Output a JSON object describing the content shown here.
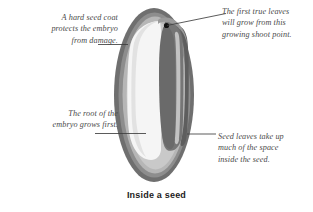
{
  "figure": {
    "caption": "Inside a seed"
  },
  "labels": {
    "seed_coat": "A hard seed coat\nprotects the embryo\nfrom damage.",
    "root": "The root of the\nembryo grows first.",
    "first_leaves": "The first true leaves\nwill grow from this\ngrowing shoot point.",
    "seed_leaves": "Seed leaves take up\nmuch of the space\ninside the seed."
  },
  "colors": {
    "background": "#ffffff",
    "seed_coat_outer": "#6f6f6f",
    "seed_coat_mid": "#8d8d8d",
    "seed_coat_inner": "#b6b6b6",
    "endosperm": "#c9c9c9",
    "root": "#f5f5f5",
    "cotyledon": "#767676",
    "cotyledon_shade": "#5e5e5e",
    "shoot_point": "#111111",
    "leader_line": "#3d3d3d",
    "label_text": "#4a4a4a",
    "caption_text": "#1c1c1c"
  },
  "parts": {
    "seed_coat": "seed-coat",
    "endosperm": "endosperm",
    "root": "embryo-root",
    "cotyledon": "seed-leaves-cotyledons",
    "shoot_point": "growing-shoot-point"
  }
}
